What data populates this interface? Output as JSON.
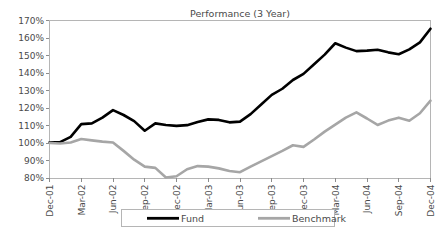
{
  "chart_data": {
    "type": "line",
    "title": "Performance (3 Year)",
    "xlabel": "",
    "ylabel": "",
    "ylim": [
      80,
      170
    ],
    "ytick_step": 10,
    "ytick_labels": [
      "80%",
      "90%",
      "100%",
      "110%",
      "120%",
      "130%",
      "140%",
      "150%",
      "160%",
      "170%"
    ],
    "ytick_values": [
      80,
      90,
      100,
      110,
      120,
      130,
      140,
      150,
      160,
      170
    ],
    "grid": false,
    "legend_position": "bottom",
    "xtick_labels": [
      "Dec-01",
      "Mar-02",
      "Jun-02",
      "Sep-02",
      "Dec-02",
      "Mar-03",
      "Jun-03",
      "Sep-03",
      "Dec-03",
      "Mar-04",
      "Jun-04",
      "Sep-04",
      "Dec-04"
    ],
    "x": [
      "Dec-01",
      "Jan-02",
      "Feb-02",
      "Mar-02",
      "Apr-02",
      "May-02",
      "Jun-02",
      "Jul-02",
      "Aug-02",
      "Sep-02",
      "Oct-02",
      "Nov-02",
      "Dec-02",
      "Jan-03",
      "Feb-03",
      "Mar-03",
      "Apr-03",
      "May-03",
      "Jun-03",
      "Jul-03",
      "Aug-03",
      "Sep-03",
      "Oct-03",
      "Nov-03",
      "Dec-03",
      "Jan-04",
      "Feb-04",
      "Mar-04",
      "Apr-04",
      "May-04",
      "Jun-04",
      "Jul-04",
      "Aug-04",
      "Sep-04",
      "Oct-04",
      "Nov-04",
      "Dec-04"
    ],
    "series": [
      {
        "name": "Fund",
        "color": "#000000",
        "width": 2.6,
        "values": [
          100.3,
          100.5,
          103.5,
          110.8,
          111.2,
          114.5,
          118.8,
          116.0,
          112.5,
          107.0,
          111.2,
          110.3,
          109.8,
          110.2,
          112.0,
          113.5,
          113.2,
          111.8,
          112.2,
          116.5,
          122.0,
          127.5,
          131.0,
          136.0,
          139.5,
          145.0,
          150.5,
          157.0,
          154.5,
          152.5,
          152.8,
          153.3,
          151.8,
          150.7,
          153.5,
          157.5,
          165.3
        ]
      },
      {
        "name": "Benchmark",
        "color": "#a6a6a6",
        "width": 2.6,
        "values": [
          100.0,
          99.7,
          100.3,
          102.3,
          101.5,
          100.8,
          100.3,
          95.5,
          90.5,
          86.5,
          85.8,
          80.3,
          81.0,
          85.0,
          86.8,
          86.5,
          85.5,
          84.0,
          83.3,
          86.5,
          89.5,
          92.5,
          95.5,
          98.7,
          97.8,
          102.0,
          106.5,
          110.5,
          114.5,
          117.5,
          114.0,
          110.3,
          112.8,
          114.5,
          112.7,
          117.0,
          124.2
        ]
      }
    ],
    "legend": [
      {
        "label": "Fund",
        "color": "#000000"
      },
      {
        "label": "Benchmark",
        "color": "#a6a6a6"
      }
    ]
  },
  "colors": {
    "fund": "#000000",
    "benchmark": "#a6a6a6",
    "axis": "#8c8c8c",
    "frame": "#b5b5b5",
    "text": "#4a4a4a",
    "background": "#ffffff"
  }
}
